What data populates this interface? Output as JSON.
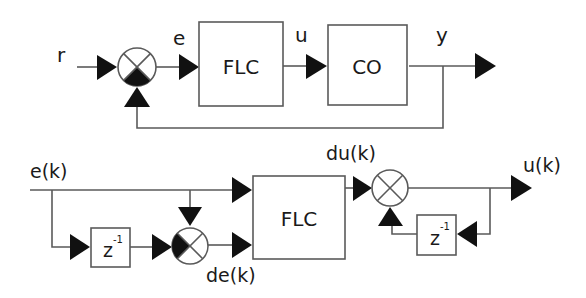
{
  "top_loop": {
    "input_label": "r",
    "error_label": "e",
    "control_label": "u",
    "output_label": "y",
    "controller_block": "FLC",
    "plant_block": "CO"
  },
  "bottom_detail": {
    "input_label": "e(k)",
    "delta_error_label": "de(k)",
    "delta_output_label": "du(k)",
    "output_label": "u(k)",
    "controller_block": "FLC",
    "delay_block_base": "z",
    "delay_block_exp": "-1",
    "feedback_delay_base": "z",
    "feedback_delay_exp": "-1"
  },
  "colors": {
    "lines": "#5a5a5a",
    "arrows": "#111111",
    "background": "#ffffff"
  }
}
